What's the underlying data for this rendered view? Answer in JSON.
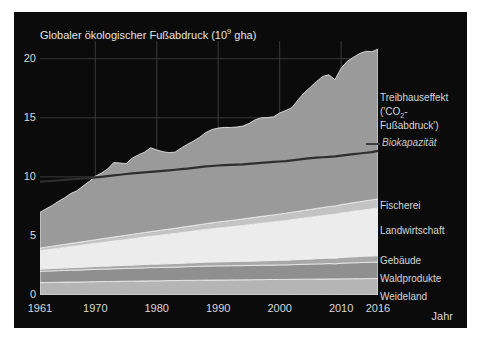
{
  "figure": {
    "background": "#ffffff",
    "panel_color": "#0b0b0b",
    "title": "Globaler ökologischer Fußabdruck (10",
    "title_sup": "9",
    "title_tail": " gha)"
  },
  "axes": {
    "x_title": "Jahr",
    "x_ticks": [
      "1961",
      "1970",
      "1980",
      "1990",
      "2000",
      "2010",
      "2016"
    ],
    "y_ticks": [
      "0",
      "5",
      "10",
      "15",
      "20"
    ]
  },
  "legend": {
    "greenhouse_line1": "Treibhauseffekt",
    "greenhouse_line2_pre": "('CO",
    "greenhouse_line2_sub": "2",
    "greenhouse_line2_post": "-",
    "greenhouse_line3": "Fußabdruck')",
    "biocapacity": "Biokapazität",
    "fishing": "Fischerei",
    "cropland": "Landwirtschaft",
    "builtup": "Gebäude",
    "forest": "Waldprodukte",
    "grazing": "Weideland"
  },
  "chart_data": {
    "type": "area",
    "stacked": true,
    "xlabel": "Jahr",
    "ylabel": "Globaler ökologischer Fußabdruck (10^9 gha)",
    "xlim": [
      1961,
      2016
    ],
    "ylim": [
      0,
      21.5
    ],
    "grid": true,
    "legend_position": "right",
    "colors": {
      "Weideland": "#b5b5b5",
      "Waldprodukte": "#8f8f8f",
      "Gebäude": "#a8a8a8",
      "Landwirtschaft": "#ececec",
      "Fischerei": "#c3c3c3",
      "Treibhauseffekt": "#9a9a9a",
      "Biokapazität": "#2e2e2e"
    },
    "x": [
      1961,
      1962,
      1963,
      1964,
      1965,
      1966,
      1967,
      1968,
      1969,
      1970,
      1971,
      1972,
      1973,
      1974,
      1975,
      1976,
      1977,
      1978,
      1979,
      1980,
      1981,
      1982,
      1983,
      1984,
      1985,
      1986,
      1987,
      1988,
      1989,
      1990,
      1991,
      1992,
      1993,
      1994,
      1995,
      1996,
      1997,
      1998,
      1999,
      2000,
      2001,
      2002,
      2003,
      2004,
      2005,
      2006,
      2007,
      2008,
      2009,
      2010,
      2011,
      2012,
      2013,
      2014,
      2015,
      2016
    ],
    "series": [
      {
        "name": "Weideland",
        "values": [
          1.05,
          1.06,
          1.07,
          1.08,
          1.09,
          1.1,
          1.1,
          1.11,
          1.12,
          1.13,
          1.14,
          1.14,
          1.15,
          1.16,
          1.17,
          1.17,
          1.18,
          1.19,
          1.2,
          1.2,
          1.21,
          1.22,
          1.22,
          1.23,
          1.24,
          1.24,
          1.25,
          1.26,
          1.26,
          1.27,
          1.27,
          1.28,
          1.28,
          1.29,
          1.29,
          1.3,
          1.3,
          1.31,
          1.31,
          1.32,
          1.32,
          1.33,
          1.33,
          1.34,
          1.34,
          1.35,
          1.35,
          1.36,
          1.36,
          1.37,
          1.37,
          1.38,
          1.38,
          1.39,
          1.39,
          1.4
        ]
      },
      {
        "name": "Waldprodukte",
        "values": [
          0.95,
          0.96,
          0.97,
          0.98,
          0.99,
          1.0,
          1.01,
          1.02,
          1.03,
          1.04,
          1.05,
          1.06,
          1.07,
          1.07,
          1.08,
          1.09,
          1.1,
          1.11,
          1.12,
          1.12,
          1.13,
          1.13,
          1.14,
          1.15,
          1.16,
          1.17,
          1.18,
          1.19,
          1.2,
          1.2,
          1.2,
          1.2,
          1.2,
          1.2,
          1.21,
          1.21,
          1.22,
          1.22,
          1.22,
          1.23,
          1.23,
          1.24,
          1.25,
          1.26,
          1.27,
          1.28,
          1.29,
          1.3,
          1.28,
          1.32,
          1.34,
          1.35,
          1.36,
          1.37,
          1.38,
          1.39
        ]
      },
      {
        "name": "Gebäude",
        "values": [
          0.2,
          0.2,
          0.21,
          0.21,
          0.22,
          0.22,
          0.23,
          0.23,
          0.24,
          0.24,
          0.25,
          0.25,
          0.26,
          0.26,
          0.27,
          0.27,
          0.28,
          0.28,
          0.29,
          0.29,
          0.3,
          0.3,
          0.31,
          0.31,
          0.32,
          0.32,
          0.33,
          0.33,
          0.34,
          0.34,
          0.35,
          0.35,
          0.36,
          0.36,
          0.37,
          0.37,
          0.38,
          0.38,
          0.39,
          0.39,
          0.4,
          0.41,
          0.42,
          0.43,
          0.44,
          0.45,
          0.46,
          0.47,
          0.48,
          0.49,
          0.5,
          0.51,
          0.52,
          0.53,
          0.54,
          0.55
        ]
      },
      {
        "name": "Landwirtschaft",
        "values": [
          1.55,
          1.6,
          1.64,
          1.69,
          1.73,
          1.78,
          1.82,
          1.87,
          1.91,
          1.96,
          2.0,
          2.05,
          2.09,
          2.14,
          2.18,
          2.23,
          2.27,
          2.32,
          2.36,
          2.41,
          2.45,
          2.5,
          2.54,
          2.59,
          2.63,
          2.68,
          2.72,
          2.77,
          2.81,
          2.86,
          2.9,
          2.95,
          2.99,
          3.04,
          3.08,
          3.13,
          3.17,
          3.22,
          3.26,
          3.31,
          3.35,
          3.4,
          3.44,
          3.49,
          3.53,
          3.58,
          3.62,
          3.67,
          3.71,
          3.76,
          3.8,
          3.85,
          3.89,
          3.94,
          3.98,
          4.03
        ]
      },
      {
        "name": "Fischerei",
        "values": [
          0.22,
          0.23,
          0.24,
          0.25,
          0.26,
          0.27,
          0.28,
          0.29,
          0.3,
          0.31,
          0.32,
          0.33,
          0.34,
          0.35,
          0.36,
          0.37,
          0.38,
          0.39,
          0.4,
          0.41,
          0.42,
          0.43,
          0.44,
          0.45,
          0.46,
          0.47,
          0.48,
          0.49,
          0.5,
          0.51,
          0.52,
          0.53,
          0.54,
          0.55,
          0.56,
          0.57,
          0.58,
          0.59,
          0.6,
          0.61,
          0.62,
          0.63,
          0.64,
          0.65,
          0.66,
          0.67,
          0.68,
          0.69,
          0.7,
          0.71,
          0.72,
          0.73,
          0.74,
          0.75,
          0.76,
          0.77
        ]
      },
      {
        "name": "Treibhauseffekt",
        "values": [
          3.03,
          3.25,
          3.45,
          3.72,
          3.94,
          4.22,
          4.38,
          4.7,
          5.0,
          5.37,
          5.56,
          5.84,
          6.3,
          6.2,
          6.05,
          6.45,
          6.65,
          6.8,
          7.1,
          6.85,
          6.62,
          6.47,
          6.45,
          6.72,
          6.95,
          7.15,
          7.4,
          7.72,
          7.9,
          7.95,
          7.95,
          7.87,
          7.85,
          7.86,
          8.0,
          8.25,
          8.35,
          8.3,
          8.3,
          8.55,
          8.7,
          8.85,
          9.45,
          9.95,
          10.35,
          10.75,
          11.1,
          11.15,
          10.7,
          11.55,
          12.05,
          12.3,
          12.55,
          12.65,
          12.55,
          12.66
        ]
      }
    ],
    "biocapacity": {
      "name": "Biokapazität",
      "values": [
        9.6,
        9.63,
        9.66,
        9.7,
        9.74,
        9.78,
        9.82,
        9.86,
        9.9,
        9.95,
        10.0,
        10.06,
        10.12,
        10.18,
        10.24,
        10.3,
        10.34,
        10.38,
        10.42,
        10.46,
        10.5,
        10.55,
        10.6,
        10.65,
        10.7,
        10.76,
        10.82,
        10.88,
        10.92,
        10.96,
        11.0,
        11.02,
        11.04,
        11.06,
        11.1,
        11.14,
        11.18,
        11.22,
        11.26,
        11.3,
        11.34,
        11.4,
        11.46,
        11.52,
        11.58,
        11.62,
        11.66,
        11.7,
        11.74,
        11.8,
        11.86,
        11.92,
        11.98,
        12.04,
        12.1,
        12.2
      ]
    }
  }
}
